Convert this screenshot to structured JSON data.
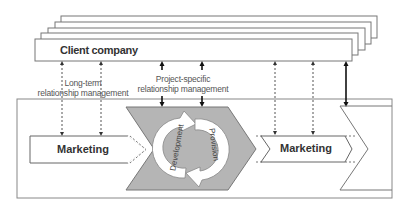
{
  "client_box": {
    "label": "Client company",
    "stack_count": 5
  },
  "relationship_labels": {
    "long_term": [
      "Long-term",
      "relationship management"
    ],
    "project_specific": [
      "Project-specific",
      "relationship management"
    ]
  },
  "process": {
    "left_stage": "Marketing",
    "center_cycle": [
      "Development",
      "Provision"
    ],
    "right_stage": "Marketing"
  },
  "colors": {
    "line": "#6e6e6e",
    "chevron_fill": "#b5b5b5",
    "cycle_arrow_fill": "#ffffff",
    "text": "#333333",
    "label_text": "#555555"
  }
}
